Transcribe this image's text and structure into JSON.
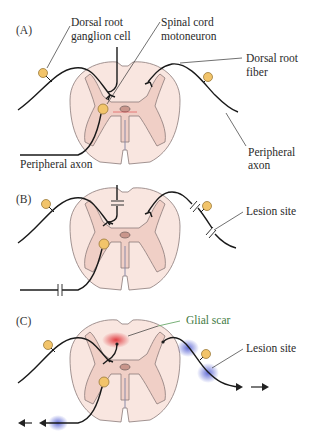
{
  "panels": {
    "A": {
      "label": "(A)",
      "annotations": {
        "drg_cell": [
          "Dorsal root",
          "ganglion cell"
        ],
        "motoneuron": [
          "Spinal cord",
          "motoneuron"
        ],
        "dorsal_root_fiber": [
          "Dorsal root",
          "fiber"
        ],
        "peripheral_axon_left": "Peripheral axon",
        "peripheral_axon_right": [
          "Peripheral",
          "axon"
        ]
      }
    },
    "B": {
      "label": "(B)",
      "annotations": {
        "lesion_site": "Lesion site"
      }
    },
    "C": {
      "label": "(C)",
      "annotations": {
        "glial_scar": "Glial scar",
        "lesion_site": "Lesion site"
      }
    }
  },
  "colors": {
    "cord_white_matter": "#f9e6e0",
    "cord_gray_matter": "#f0cfc6",
    "neuron_cell_body": "#f2c46a",
    "glial_scar": "#e0353a",
    "regeneration_glow": "#5a66d6",
    "glial_label": "#3f7a3f"
  }
}
